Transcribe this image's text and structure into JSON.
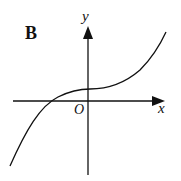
{
  "diagram": {
    "panel_label": "B",
    "axes": {
      "x_label": "x",
      "y_label": "y",
      "origin_label": "O"
    },
    "curve": "cubic-like increasing curve with positive y-intercept, crossing x-axis at negative x",
    "colors": {
      "stroke": "#111111",
      "background": "#ffffff"
    }
  }
}
